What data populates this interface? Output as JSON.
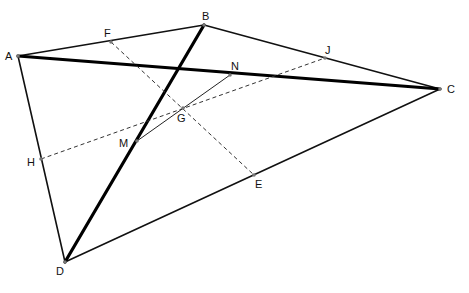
{
  "diagram": {
    "points": [
      {
        "id": "A",
        "label": "A"
      },
      {
        "id": "B",
        "label": "B"
      },
      {
        "id": "C",
        "label": "C"
      },
      {
        "id": "D",
        "label": "D"
      },
      {
        "id": "F",
        "label": "F"
      },
      {
        "id": "J",
        "label": "J"
      },
      {
        "id": "N",
        "label": "N"
      },
      {
        "id": "G",
        "label": "G"
      },
      {
        "id": "M",
        "label": "M"
      },
      {
        "id": "H",
        "label": "H"
      },
      {
        "id": "E",
        "label": "E"
      }
    ],
    "segments": [
      {
        "from": "A",
        "to": "B",
        "style": "thin"
      },
      {
        "from": "B",
        "to": "C",
        "style": "thin"
      },
      {
        "from": "C",
        "to": "D",
        "style": "thin"
      },
      {
        "from": "D",
        "to": "A",
        "style": "thin"
      },
      {
        "from": "A",
        "to": "C",
        "style": "thick"
      },
      {
        "from": "B",
        "to": "D",
        "style": "thick"
      },
      {
        "from": "F",
        "to": "E",
        "style": "dashed"
      },
      {
        "from": "H",
        "to": "J",
        "style": "dashed"
      },
      {
        "from": "M",
        "to": "N",
        "style": "fine"
      }
    ],
    "colors": {
      "line": "#111111",
      "point": "#777777",
      "background": "#ffffff"
    }
  }
}
